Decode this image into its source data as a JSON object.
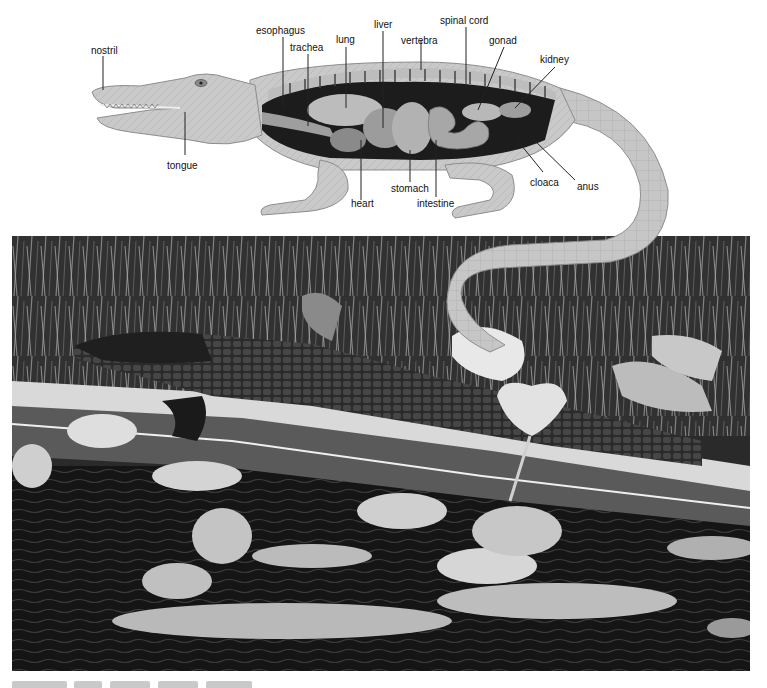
{
  "figure": {
    "diagram": {
      "subject": "alligator internal anatomy",
      "labels": [
        {
          "id": "nostril",
          "text": "nostril"
        },
        {
          "id": "esophagus",
          "text": "esophagus"
        },
        {
          "id": "trachea",
          "text": "trachea"
        },
        {
          "id": "lung",
          "text": "lung"
        },
        {
          "id": "liver",
          "text": "liver"
        },
        {
          "id": "vertebra",
          "text": "vertebra"
        },
        {
          "id": "spinal_cord",
          "text": "spinal cord"
        },
        {
          "id": "gonad",
          "text": "gonad"
        },
        {
          "id": "kidney",
          "text": "kidney"
        },
        {
          "id": "tongue",
          "text": "tongue"
        },
        {
          "id": "heart",
          "text": "heart"
        },
        {
          "id": "stomach",
          "text": "stomach"
        },
        {
          "id": "intestine",
          "text": "intestine"
        },
        {
          "id": "cloaca",
          "text": "cloaca"
        },
        {
          "id": "anus",
          "text": "anus"
        }
      ]
    },
    "photo": {
      "subject": "alligator resting on a log among water lilies"
    },
    "colors": {
      "background": "#ffffff",
      "label_text": "#111111",
      "leader_line": "#222222",
      "skin_light": "#c8c8c8",
      "skin_mid": "#a6a6a6",
      "body_cavity": "#1c1c1c",
      "photo_dark": "#1e1e1e"
    }
  }
}
